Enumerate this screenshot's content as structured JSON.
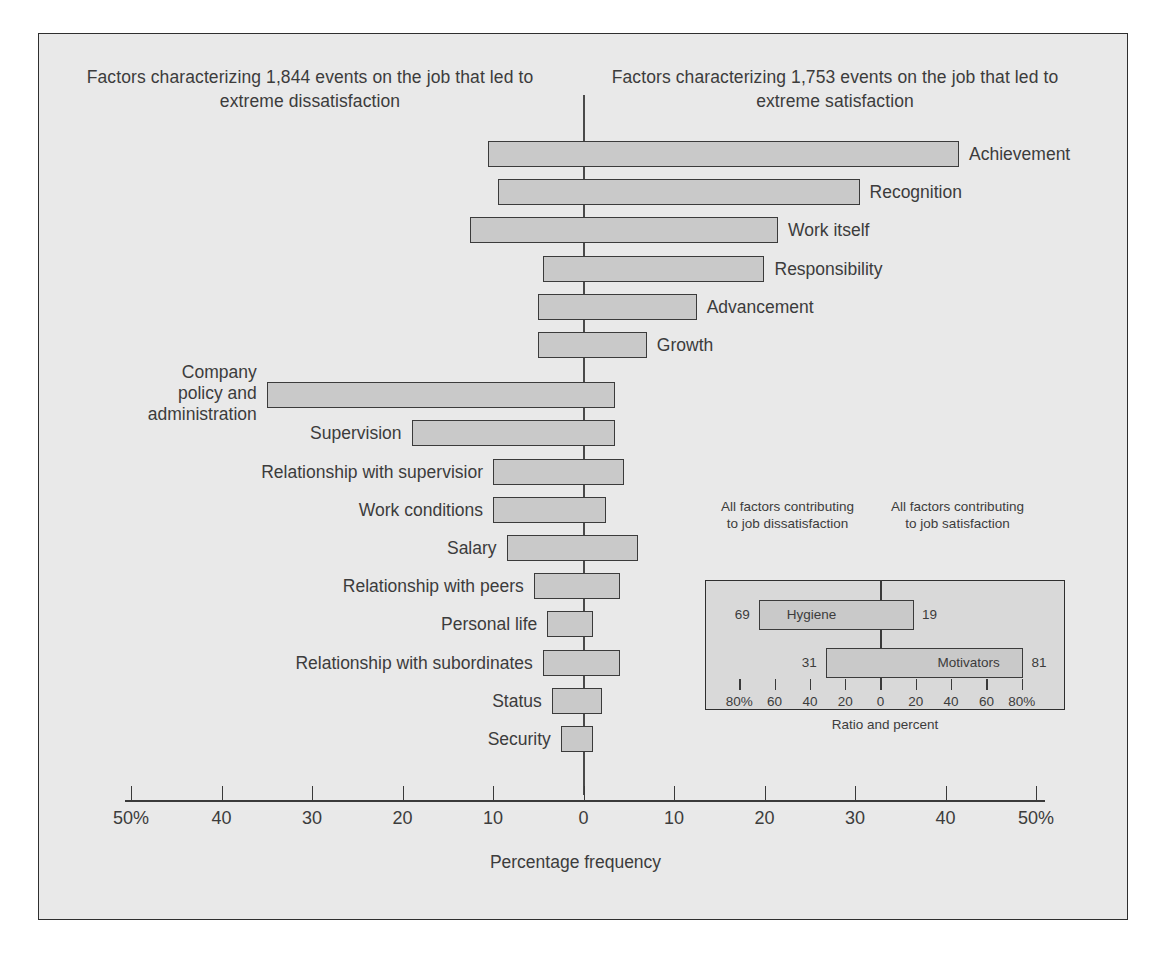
{
  "headers": {
    "left": "Factors characterizing 1,844 events on the job that led to extreme dissatisfaction",
    "right": "Factors characterizing 1,753 events on the job that led to extreme satisfaction"
  },
  "axis": {
    "title": "Percentage frequency",
    "tick_labels": [
      "50%",
      "40",
      "30",
      "20",
      "10",
      "0",
      "10",
      "20",
      "30",
      "40",
      "50%"
    ]
  },
  "inset": {
    "caption_left": "All factors contributing to job dissatisfaction",
    "caption_right": "All factors contributing to job satisfaction",
    "axis_title": "Ratio and percent",
    "tick_labels": [
      "80%",
      "60",
      "40",
      "20",
      "0",
      "20",
      "40",
      "60",
      "80%"
    ],
    "bars": [
      {
        "label": "Hygiene",
        "left_value": "69",
        "right_value": "19"
      },
      {
        "label": "Motivators",
        "left_value": "31",
        "right_value": "81"
      }
    ]
  },
  "bars": [
    {
      "label": "Achievement",
      "left": 10.5,
      "right": 41.5,
      "label_side": "right"
    },
    {
      "label": "Recognition",
      "left": 9.5,
      "right": 30.5,
      "label_side": "right"
    },
    {
      "label": "Work itself",
      "left": 12.5,
      "right": 21.5,
      "label_side": "right"
    },
    {
      "label": "Responsibility",
      "left": 4.5,
      "right": 20.0,
      "label_side": "right"
    },
    {
      "label": "Advancement",
      "left": 5.0,
      "right": 12.5,
      "label_side": "right"
    },
    {
      "label": "Growth",
      "left": 5.0,
      "right": 7.0,
      "label_side": "right"
    },
    {
      "label": "Company policy and administration",
      "left": 35.0,
      "right": 3.5,
      "label_side": "left"
    },
    {
      "label": "Supervision",
      "left": 19.0,
      "right": 3.5,
      "label_side": "left"
    },
    {
      "label": "Relationship with supervisior",
      "left": 10.0,
      "right": 4.5,
      "label_side": "left"
    },
    {
      "label": "Work conditions",
      "left": 10.0,
      "right": 2.5,
      "label_side": "left"
    },
    {
      "label": "Salary",
      "left": 8.5,
      "right": 6.0,
      "label_side": "left"
    },
    {
      "label": "Relationship with peers",
      "left": 5.5,
      "right": 4.0,
      "label_side": "left"
    },
    {
      "label": "Personal life",
      "left": 4.0,
      "right": 1.0,
      "label_side": "left"
    },
    {
      "label": "Relationship with subordinates",
      "left": 4.5,
      "right": 4.0,
      "label_side": "left"
    },
    {
      "label": "Status",
      "left": 3.5,
      "right": 2.0,
      "label_side": "left"
    },
    {
      "label": "Security",
      "left": 2.5,
      "right": 1.0,
      "label_side": "left"
    }
  ],
  "chart_data": {
    "type": "bar",
    "subtitle_left": "Factors characterizing 1,844 events on the job that led to extreme dissatisfaction",
    "subtitle_right": "Factors characterizing 1,753 events on the job that led to extreme satisfaction",
    "xlabel": "Percentage frequency",
    "ylabel": "",
    "xlim": [
      -50,
      50
    ],
    "xticks": [
      -50,
      -40,
      -30,
      -20,
      -10,
      0,
      10,
      20,
      30,
      40,
      50
    ],
    "xtick_labels": [
      "50%",
      "40",
      "30",
      "20",
      "10",
      "0",
      "10",
      "20",
      "30",
      "40",
      "50%"
    ],
    "orientation": "horizontal",
    "grid": false,
    "legend": "none",
    "categories": [
      "Achievement",
      "Recognition",
      "Work itself",
      "Responsibility",
      "Advancement",
      "Growth",
      "Company policy and administration",
      "Supervision",
      "Relationship with supervisior",
      "Work conditions",
      "Salary",
      "Relationship with peers",
      "Personal life",
      "Relationship with subordinates",
      "Status",
      "Security"
    ],
    "series": [
      {
        "name": "Dissatisfaction (left of zero, %)",
        "values": [
          10.5,
          9.5,
          12.5,
          4.5,
          5.0,
          5.0,
          35.0,
          19.0,
          10.0,
          10.0,
          8.5,
          5.5,
          4.0,
          4.5,
          3.5,
          2.5
        ]
      },
      {
        "name": "Satisfaction (right of zero, %)",
        "values": [
          41.5,
          30.5,
          21.5,
          20.0,
          12.5,
          7.0,
          3.5,
          3.5,
          4.5,
          2.5,
          6.0,
          4.0,
          1.0,
          4.0,
          2.0,
          1.0
        ]
      }
    ],
    "inset_chart": {
      "type": "bar",
      "orientation": "horizontal",
      "xlabel": "Ratio and percent",
      "xlim": [
        -100,
        100
      ],
      "xticks": [
        -80,
        -60,
        -40,
        -20,
        0,
        20,
        40,
        60,
        80
      ],
      "xtick_labels": [
        "80%",
        "60",
        "40",
        "20",
        "0",
        "20",
        "40",
        "60",
        "80%"
      ],
      "label_left": "All factors contributing to job dissatisfaction",
      "label_right": "All factors contributing to job satisfaction",
      "categories": [
        "Hygiene",
        "Motivators"
      ],
      "series": [
        {
          "name": "Contributing to job dissatisfaction (%)",
          "values": [
            69,
            31
          ]
        },
        {
          "name": "Contributing to job satisfaction (%)",
          "values": [
            19,
            81
          ]
        }
      ]
    }
  }
}
